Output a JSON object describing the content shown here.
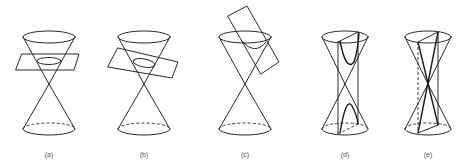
{
  "figure": {
    "panels": [
      {
        "id": "a",
        "label": "(a)",
        "section": "circle",
        "center_x": 49
      },
      {
        "id": "b",
        "label": "(b)",
        "section": "ellipse",
        "center_x": 144
      },
      {
        "id": "c",
        "label": "(c)",
        "section": "parabola",
        "center_x": 245
      },
      {
        "id": "d",
        "label": "(d)",
        "section": "hyperbola",
        "center_x": 345
      },
      {
        "id": "e",
        "label": "(e)",
        "section": "degenerate (intersecting lines)",
        "center_x": 428
      }
    ]
  }
}
